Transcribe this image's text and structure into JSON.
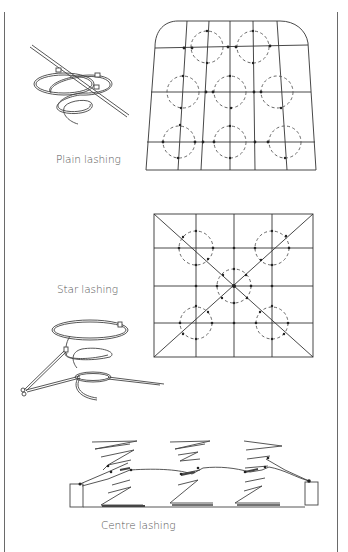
{
  "figure": {
    "panels": [
      {
        "id": "plain",
        "caption": "Plain lashing"
      },
      {
        "id": "star",
        "caption": "Star lashing"
      },
      {
        "id": "centre",
        "caption": "Centre lashing"
      }
    ],
    "colors": {
      "line": "#333333",
      "dashed": "#555555",
      "caption": "#555555",
      "border": "#6a6a6a"
    }
  }
}
